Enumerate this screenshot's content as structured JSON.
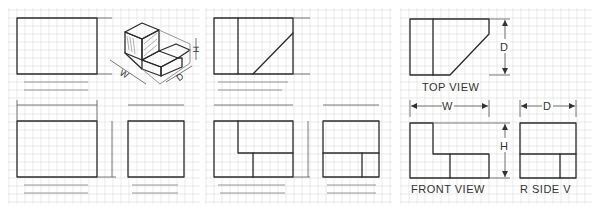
{
  "figure": {
    "grid": {
      "spacing": 8,
      "color": "#dcdcdc"
    },
    "ink_color": "#2a2a2a",
    "panels": [
      {
        "id": "exercise-1",
        "description": "blank front/top/side grid with isometric pictorial",
        "isometric_labels": {
          "width": "W",
          "height": "H",
          "depth": "D"
        }
      },
      {
        "id": "exercise-2",
        "description": "partially completed top, front and side views"
      },
      {
        "id": "solution",
        "description": "completed orthographic views with dimensions"
      }
    ],
    "views": {
      "top": {
        "label": "TOP VIEW",
        "dimension": "D"
      },
      "front": {
        "label": "FRONT VIEW",
        "dimension_w": "W",
        "dimension_h": "H"
      },
      "side": {
        "label": "R SIDE V",
        "dimension": "D"
      }
    }
  }
}
